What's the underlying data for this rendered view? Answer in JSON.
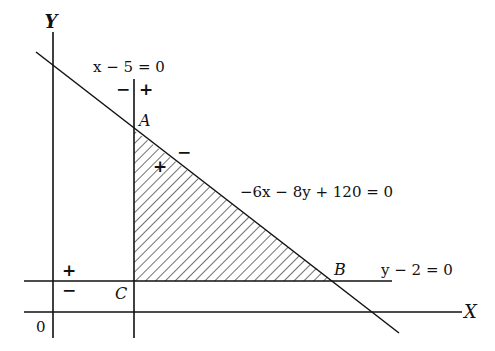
{
  "axes": {
    "x_label": "X",
    "y_label": "Y",
    "origin_label": "0"
  },
  "lines": {
    "vertical": {
      "equation": "x − 5 = 0",
      "left_sign": "−",
      "right_sign": "+"
    },
    "horizontal": {
      "equation": "y − 2 = 0",
      "above_sign": "+",
      "below_sign": "−"
    },
    "diagonal": {
      "equation": "−6x − 8y + 120 = 0",
      "inside_sign": "+",
      "outside_sign": "−"
    }
  },
  "points": {
    "A": "A",
    "B": "B",
    "C": "C"
  },
  "region": {
    "description": "shaded triangular feasible region ABC",
    "fill_pattern": "diagonal hatch"
  },
  "colors": {
    "ink": "#111111",
    "background": "#ffffff"
  }
}
